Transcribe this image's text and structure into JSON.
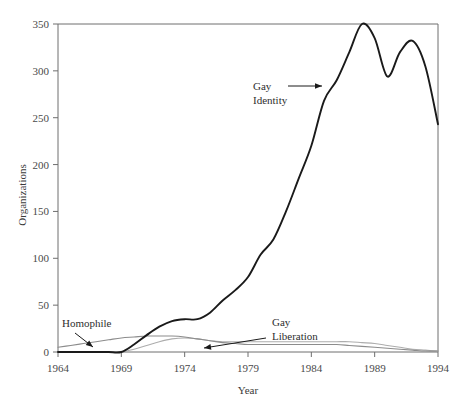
{
  "chart_data": {
    "type": "line",
    "title": "",
    "subtitle": "",
    "xlabel": "Year",
    "ylabel": "Organizations",
    "xlim": [
      1964,
      1994
    ],
    "ylim": [
      0,
      350
    ],
    "grid": false,
    "legend_position": "inline-annotations",
    "xticks": [
      1964,
      1969,
      1974,
      1979,
      1984,
      1989,
      1994
    ],
    "yticks": [
      0,
      50,
      100,
      150,
      200,
      250,
      300,
      350
    ],
    "x": [
      1964,
      1965,
      1966,
      1967,
      1968,
      1969,
      1970,
      1971,
      1972,
      1973,
      1974,
      1975,
      1976,
      1977,
      1978,
      1979,
      1980,
      1981,
      1982,
      1983,
      1984,
      1985,
      1986,
      1987,
      1988,
      1989,
      1990,
      1991,
      1992,
      1993,
      1994
    ],
    "series": [
      {
        "name": "Gay Identity",
        "color": "#1a1a1a",
        "width": 1.9,
        "values": [
          0,
          0,
          0,
          0,
          0,
          0,
          8,
          18,
          27,
          33,
          35,
          35,
          42,
          55,
          66,
          80,
          104,
          120,
          150,
          185,
          220,
          268,
          290,
          320,
          350,
          335,
          294,
          320,
          332,
          305,
          243
        ]
      },
      {
        "name": "Homophile",
        "color": "#8c8c8c",
        "width": 1.1,
        "values": [
          5,
          7,
          9,
          11,
          13,
          15,
          16,
          17,
          17,
          17,
          16,
          14,
          12,
          10,
          9,
          8,
          8,
          8,
          8,
          8,
          8,
          8,
          8,
          7,
          6,
          5,
          4,
          3,
          2,
          1,
          1
        ]
      },
      {
        "name": "Gay Liberation",
        "color": "#adadad",
        "width": 1.1,
        "values": [
          0,
          0,
          0,
          0,
          0,
          0,
          3,
          7,
          11,
          14,
          15,
          14,
          12,
          11,
          11,
          11,
          11,
          11,
          11,
          11,
          11,
          11,
          11,
          11,
          10,
          9,
          7,
          5,
          3,
          2,
          1
        ]
      }
    ],
    "annotations": [
      {
        "label_line1": "Gay",
        "label_line2": "Identity",
        "arrow": "right"
      },
      {
        "label_line1": "Gay",
        "label_line2": "Liberation",
        "arrow": "left"
      },
      {
        "label_line1": "Homophile",
        "label_line2": "",
        "arrow": "down-right"
      }
    ],
    "colors": {
      "background": "#ffffff",
      "frame": "#6e6e6e",
      "primary_line": "#1a1a1a",
      "homophile_line": "#8c8c8c",
      "liberation_line": "#adadad",
      "text": "#3a3a3a"
    }
  }
}
